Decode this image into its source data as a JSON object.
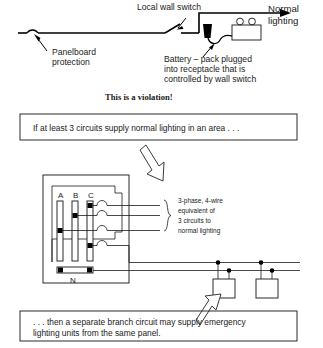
{
  "top_diagram": {
    "labels": {
      "panelboard_protection": "Panelboard\nprotection",
      "panelboard_protection_line1": "Panelboard",
      "panelboard_protection_line2": "protection",
      "local_wall_switch": "Local wall switch",
      "normal_lighting_line1": "Normal",
      "normal_lighting_line2": "lighting",
      "battery_pack_line1": "Battery – pack plugged",
      "battery_pack_line2": "into receptacle that is",
      "battery_pack_line3": "controlled by wall switch"
    },
    "symbols": {
      "breaker": "circuit-breaker-arc",
      "switch": "single-pole-switch",
      "receptacle": "receptacle-plug",
      "battery_pack": "battery-pack-unit",
      "lamp_heads": 2
    }
  },
  "violation_note": {
    "text": "This is a violation!"
  },
  "callout_top": {
    "text": "If at least 3 circuits supply normal lighting in an area . . ."
  },
  "callout_bottom": {
    "line1": ". . . then a separate branch circuit may supply emergency",
    "line2": "lighting units from the same panel."
  },
  "panel_diagram": {
    "bus_labels": [
      "A",
      "B",
      "C"
    ],
    "neutral_label": "N",
    "annotation": {
      "line1": "3-phase, 4-wire",
      "line2": "equivalent of",
      "line3": "3 circuits to",
      "line4": "normal lighting"
    },
    "feeder_wire_count": 4,
    "emergency_units": 2,
    "emergency_unit_name": "emergency-lighting-unit"
  },
  "colors": {
    "ink": "#000000",
    "text": "#1a1a1a",
    "outline": "#2b2b2b",
    "background": "#ffffff"
  }
}
